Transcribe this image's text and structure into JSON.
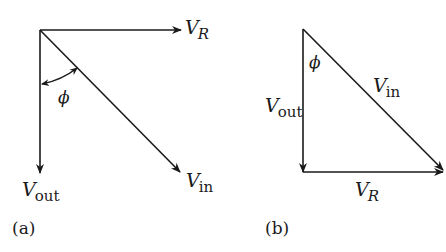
{
  "diagram_a": {
    "caption": "(a)",
    "vectors": {
      "v_r": {
        "label_main": "V",
        "label_sub": "R"
      },
      "v_out": {
        "label_main": "V",
        "label_sub": "out"
      },
      "v_in": {
        "label_main": "V",
        "label_sub": "in"
      }
    },
    "angle_label": "ϕ"
  },
  "diagram_b": {
    "caption": "(b)",
    "vectors": {
      "v_r": {
        "label_main": "V",
        "label_sub": "R"
      },
      "v_out": {
        "label_main": "V",
        "label_sub": "out"
      },
      "v_in": {
        "label_main": "V",
        "label_sub": "in"
      }
    },
    "angle_label": "ϕ"
  },
  "colors": {
    "ink": "#1a1a1a",
    "background": "#ffffff"
  }
}
